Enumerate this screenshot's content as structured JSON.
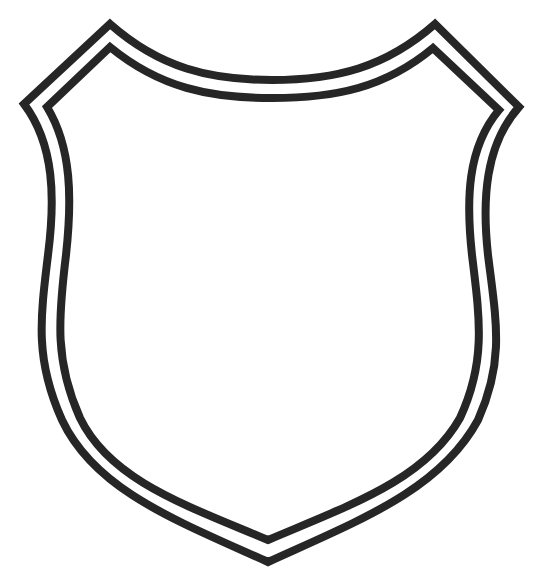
{
  "image": {
    "subject": "blank shield outline",
    "description": "Heraldic shield / badge shape drawn with a double black outline on a white background, empty interior"
  },
  "colors": {
    "background": "#ffffff",
    "outline": "#262626",
    "fill": "#ffffff"
  },
  "shield": {
    "outer_outline_stroke_width": 8,
    "inner_outline_stroke_width": 8,
    "gap_between_outlines": 14
  }
}
